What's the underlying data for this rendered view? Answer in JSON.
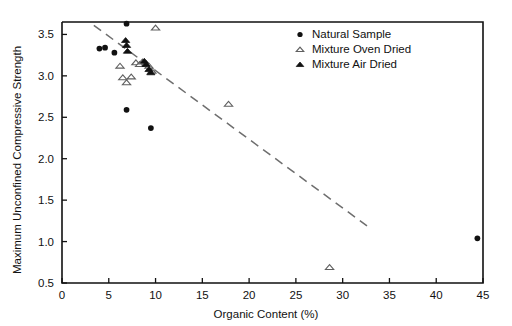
{
  "chart_data": {
    "type": "scatter",
    "title": "",
    "xlabel": "Organic Content  (%)",
    "ylabel": "Maximum Unconfined Compressive Strength",
    "xlim": [
      0,
      45
    ],
    "ylim": [
      0.5,
      3.65
    ],
    "xticks": [
      0,
      5,
      10,
      15,
      20,
      25,
      30,
      35,
      40,
      45
    ],
    "xtick_labels": [
      "0",
      "5",
      "10",
      "15",
      "20",
      "25",
      "30",
      "35",
      "40",
      "45"
    ],
    "yticks": [
      0.5,
      1.0,
      1.5,
      2.0,
      2.5,
      3.0,
      3.5
    ],
    "ytick_labels": [
      "0.5",
      "1.0",
      "1.5",
      "2.0",
      "2.5",
      "3.0",
      "3.5"
    ],
    "grid": false,
    "legend_position": "top-right",
    "series": [
      {
        "name": "Natural Sample",
        "marker": "filled-circle",
        "color": "#111111",
        "points": [
          [
            4.0,
            3.33
          ],
          [
            4.6,
            3.34
          ],
          [
            5.6,
            3.28
          ],
          [
            6.9,
            3.63
          ],
          [
            6.9,
            2.59
          ],
          [
            9.5,
            2.37
          ],
          [
            44.4,
            1.04
          ]
        ]
      },
      {
        "name": "Mixture Oven Dried",
        "marker": "open-triangle",
        "color": "#5f5f5f",
        "points": [
          [
            6.2,
            3.12
          ],
          [
            6.5,
            2.98
          ],
          [
            6.9,
            2.92
          ],
          [
            7.4,
            2.99
          ],
          [
            7.9,
            3.16
          ],
          [
            8.3,
            3.14
          ],
          [
            8.6,
            3.17
          ],
          [
            9.0,
            3.15
          ],
          [
            9.3,
            3.12
          ],
          [
            9.6,
            3.06
          ],
          [
            10.0,
            3.58
          ],
          [
            17.8,
            2.66
          ],
          [
            28.6,
            0.69
          ]
        ]
      },
      {
        "name": "Mixture Air Dried",
        "marker": "filled-triangle",
        "color": "#111111",
        "points": [
          [
            6.8,
            3.43
          ],
          [
            6.9,
            3.37
          ],
          [
            7.0,
            3.3
          ],
          [
            8.8,
            3.18
          ],
          [
            9.0,
            3.14
          ],
          [
            9.3,
            3.08
          ],
          [
            9.5,
            3.04
          ]
        ]
      }
    ],
    "trend_line": {
      "style": "dashed",
      "color": "#6e6e6e",
      "x0": 3.4,
      "y0": 3.61,
      "x1": 32.6,
      "y1": 1.19
    }
  },
  "legend": {
    "entries": [
      {
        "label": "Natural Sample",
        "marker": "filled-circle"
      },
      {
        "label": "Mixture Oven Dried",
        "marker": "open-triangle"
      },
      {
        "label": "Mixture Air Dried",
        "marker": "filled-triangle"
      }
    ]
  }
}
